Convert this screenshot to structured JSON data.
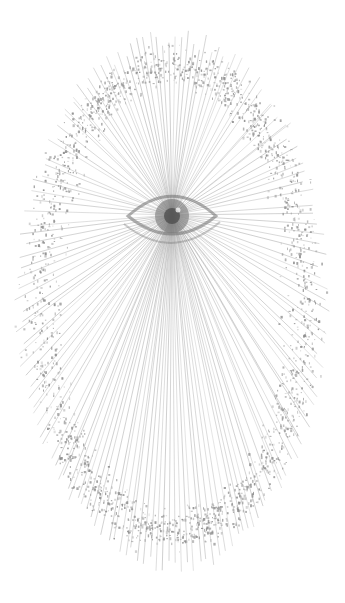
{
  "artwork": {
    "subject": "string-art eye with radiating lines and stippled oval ring",
    "canvas": {
      "width": 345,
      "height": 603,
      "background": "#ffffff"
    },
    "center": {
      "x": 172,
      "y": 215
    },
    "rays": {
      "count": 150,
      "color": "#9a9a9a",
      "opacity": 0.55,
      "width": 0.8,
      "ellipse": {
        "cx": 172,
        "cy": 300,
        "rx": 150,
        "ry": 262
      }
    },
    "ring": {
      "color": "#8c8c8c",
      "ellipse": {
        "cx": 172,
        "cy": 298,
        "rx": 132,
        "ry": 232
      },
      "thickness": 26,
      "dots": 3200
    },
    "eye": {
      "cx": 172,
      "cy": 216,
      "outer_rx": 44,
      "outer_ry": 18,
      "iris_r": 17,
      "pupil_r": 8,
      "color": "#6e6e6e"
    }
  }
}
